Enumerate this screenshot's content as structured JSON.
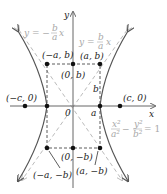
{
  "diagram": {
    "type": "hyperbola",
    "equation": {
      "num1": "x²",
      "den1": "a²",
      "minus": "−",
      "num2": "y²",
      "den2": "b²",
      "rhs": "= 1"
    },
    "axes": {
      "x_label": "x",
      "y_label": "y",
      "origin_label": "0"
    },
    "asymptotes": [
      {
        "label_lhs": "y = −",
        "frac_num": "b",
        "frac_den": "a",
        "label_rhs": "x"
      },
      {
        "label_lhs": "y =",
        "frac_num": "b",
        "frac_den": "a",
        "label_rhs": "x"
      }
    ],
    "points": {
      "neg_a_b": "(−a, b)",
      "a_b": "(a, b)",
      "zero_b": "(0, b)",
      "neg_c_0": "(−c, 0)",
      "c_0": "(c, 0)",
      "zero_neg_b": "(0, −b)",
      "neg_a_neg_b": "(−a, −b)",
      "a_neg_b": "(a, −b)"
    },
    "segment_labels": {
      "a": "a",
      "b": "b"
    },
    "colors": {
      "curve": "#555555",
      "asymptote": "#b8b8b8",
      "axis": "#666666",
      "point": "#111111",
      "equation": "#a0a0a0"
    }
  }
}
